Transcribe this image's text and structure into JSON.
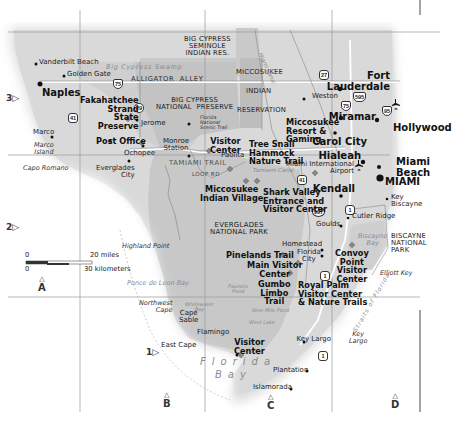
{
  "map": {
    "title": "South Florida / Everglades Region",
    "colors": {
      "land": "#dcdcdc",
      "park": "#c4c4c4",
      "reservation": "#b8b8b8",
      "water": "#ffffff",
      "grid": "#9a9a9a",
      "text": "#111111"
    },
    "grid_rows": [
      {
        "label": "3",
        "marker": "▷"
      },
      {
        "label": "2",
        "marker": "▷"
      },
      {
        "label": "1",
        "marker": "▷"
      }
    ],
    "grid_cols": [
      {
        "label": "A",
        "marker": "△"
      },
      {
        "label": "B",
        "marker": "△"
      },
      {
        "label": "C",
        "marker": "△"
      },
      {
        "label": "D",
        "marker": "△"
      }
    ],
    "scale": {
      "zero_top": "0",
      "miles": "20 miles",
      "zero_bottom": "0",
      "km": "30 kilometers"
    },
    "areas": {
      "seminole": "BIG CYPRESS\nSEMINOLE\nINDIAN RES.",
      "miccosukee": "MICCOSUKEE",
      "indian": "INDIAN",
      "reservation": "RESERVATION",
      "big_cypress": "BIG CYPRESS\nNATIONAL  PRESERVE",
      "everglades": "EVERGLADES\nNATIONAL PARK",
      "biscayne": "BISCAYNE\nNATIONAL\nPARK"
    },
    "water": {
      "big_cypress_swamp": "Big Cypress Swamp",
      "ponce_de_leon_bay": "Ponce de Leon Bay",
      "biscayne_bay": "Biscayne\nBay",
      "florida_bay_1": "Florida",
      "florida_bay_2": "Bay",
      "straits": "Straits of Florida",
      "tamiami_canal": "Tamiami Canal",
      "miami_canal": "Miami Canal",
      "whitewater_bay": "Whitewater\nBay",
      "nine_mile_pond": "Nine Mile Pond",
      "west_lake": "West Lake",
      "paurotis_pond": "Paurotis\nPond"
    },
    "roads": {
      "alligator_alley": "ALLIGATOR  ALLEY",
      "tamiami_trail": "TAMIAMI TRAIL",
      "loop_rd": "LOOP RD",
      "scenic_trail": "Florida\nNational\nScenic Trail"
    },
    "shields": {
      "i75_north": "75",
      "us29": "29",
      "us41_west": "41",
      "us27": "27",
      "i595": "595",
      "i75_east": "75",
      "i95": "95",
      "us41_east": "41",
      "sr997": "997",
      "us1_north": "1",
      "us1_south": "1"
    },
    "cities": {
      "naples": "Naples",
      "fort_lauderdale": "Fort\nLauderdale",
      "miramar": "Miramar",
      "hollywood": "Hollywood",
      "carol_city": "Carol City",
      "hialeah": "Hialeah",
      "miami_beach": "Miami\nBeach",
      "miami": "MIAMI",
      "kendall": "Kendall"
    },
    "places": {
      "vanderbilt_beach": "Vanderbilt Beach",
      "golden_gate": "Golden Gate",
      "jerome": "Jerome",
      "marco": "Marco",
      "marco_island": "Marco\nIsland",
      "capo_romano": "Capo Romano",
      "ochopee": "Ochopee",
      "everglades_city": "Everglades\nCity",
      "monroe_station": "Monroe\nStation",
      "paolita": "Paolita",
      "weston": "Weston",
      "miami_airport": "Miami International\nAirport",
      "key_biscayne": "Key\nBiscayne",
      "cutler_ridge": "Cutler Ridge",
      "goulds": "Goulds",
      "homestead": "Homestead",
      "florida_city": "Florida\nCity",
      "elliott_key": "Elliott Key",
      "highland_point": "Highland Point",
      "northwest_cape": "Northwest\nCape",
      "cape_sable": "Cape\nSable",
      "east_cape": "East Cape",
      "flamingo": "Flamingo",
      "key_largo_town": "Key Largo",
      "key_largo": "Key\nLargo",
      "plantation": "Plantation",
      "islamorada": "Islamorada"
    },
    "pois": {
      "fakahatchee": "Fakahatchee\nStrand\nState\nPreserve",
      "post_office": "Post Office",
      "visitor_center_bc": "Visitor\nCenter",
      "tree_snail": "Tree Snail\nHammock\nNature Trail",
      "miccosukee_resort": "Miccosukee\nResort &\nGaming",
      "miccosukee_village": "Miccosukee\nIndian Village",
      "shark_valley": "Shark Valley\nEntrance and\nVisitor Center",
      "pinelands": "Pinelands Trail",
      "main_visitor": "Main Visitor\nCenter",
      "gumbo_limbo": "Gumbo\nLimbo\nTrail",
      "royal_palm": "Royal Palm\nVisitor Center\n& Nature Trails",
      "convoy_point": "Convoy\nPoint\nVisitor\nCenter",
      "flamingo_visitor": "Visitor\nCenter"
    }
  }
}
